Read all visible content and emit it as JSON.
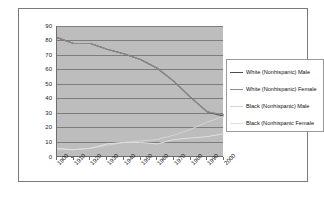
{
  "chart_data": {
    "type": "line",
    "title": "",
    "xlabel": "",
    "ylabel": "",
    "ylim": [
      0,
      90
    ],
    "ytick_step": 10,
    "grid": true,
    "legend_position": "right",
    "categories": [
      "1900",
      "1910",
      "1920",
      "1930",
      "1940",
      "1950",
      "1960",
      "1970",
      "1980",
      "1990",
      "2000"
    ],
    "series": [
      {
        "name": "White (Nonhispanic) Male",
        "color": "#4d4d4d",
        "values": [
          82,
          78,
          78,
          74,
          71,
          67,
          61,
          52,
          41,
          31,
          28
        ]
      },
      {
        "name": "White (Nonhispanic) Female",
        "color": "#8c8c8c",
        "values": [
          82,
          78,
          78,
          74,
          71,
          67,
          61,
          52,
          41,
          31,
          29
        ]
      },
      {
        "name": "Black (Nonhispanic) Male",
        "color": "#d4d4d4",
        "values": [
          5,
          5,
          6,
          8,
          10,
          11,
          12,
          15,
          19,
          24,
          28
        ]
      },
      {
        "name": "Black (Nonhispanic Female",
        "color": "#e0e0e0",
        "values": [
          6,
          5,
          6,
          9,
          10,
          10,
          9,
          12,
          13,
          14,
          16
        ]
      }
    ],
    "y_ticks": [
      "90",
      "80",
      "70",
      "60",
      "50",
      "40",
      "30",
      "20",
      "10",
      "0"
    ],
    "x_ticks": [
      "1900",
      "1910",
      "1920",
      "1930",
      "1940",
      "1950",
      "1960",
      "1970",
      "1980",
      "1990",
      "2000"
    ],
    "legend_entries": [
      "White (Nonhispanic) Male",
      "White (Nonhispanic) Female",
      "Black (Nonhispanic) Male",
      "Black (Nonhispanic Female"
    ],
    "plot_background": "#bdbdbd",
    "gridline_color": "#7d7d7d",
    "frame_color": "#7a7a7a"
  }
}
